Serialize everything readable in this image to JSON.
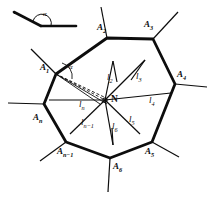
{
  "figure": {
    "background_color": "#ffffff",
    "ink_color": "#0d0d0d",
    "width": 210,
    "height": 198
  },
  "inset": {
    "name": "angle-alpha-inset",
    "angle_label": "α",
    "description": "Two rays meeting at a vertex with interior angle alpha marked by an arc"
  },
  "center_point": {
    "label": "N",
    "x": 105,
    "y": 100
  },
  "vertices": [
    {
      "id": "A1",
      "label_base": "A",
      "label_sub": "1",
      "label": "A₁",
      "x": 56,
      "y": 74,
      "label_x": 40,
      "label_y": 63
    },
    {
      "id": "A2",
      "label_base": "A",
      "label_sub": "2",
      "label": "A₂",
      "x": 107,
      "y": 38,
      "label_x": 97,
      "label_y": 23
    },
    {
      "id": "A3",
      "label_base": "A",
      "label_sub": "3",
      "label": "A₃",
      "x": 153,
      "y": 39,
      "label_x": 144,
      "label_y": 20
    },
    {
      "id": "A4",
      "label_base": "A",
      "label_sub": "4",
      "label": "A₄",
      "x": 175,
      "y": 84,
      "label_x": 177,
      "label_y": 70
    },
    {
      "id": "A5",
      "label_base": "A",
      "label_sub": "5",
      "label": "A₅",
      "x": 152,
      "y": 142,
      "label_x": 145,
      "label_y": 147
    },
    {
      "id": "A6",
      "label_base": "A",
      "label_sub": "6",
      "label": "A₆",
      "x": 110,
      "y": 158,
      "label_x": 113,
      "label_y": 162
    },
    {
      "id": "An-1",
      "label_base": "A",
      "label_sub": "n−1",
      "label": "Aₙ₋₁",
      "x": 66,
      "y": 142,
      "label_x": 62,
      "label_y": 147
    },
    {
      "id": "An",
      "label_base": "A",
      "label_sub": "n",
      "label": "Aₙ",
      "x": 44,
      "y": 104,
      "label_x": 33,
      "label_y": 113
    }
  ],
  "segments": [
    {
      "id": "l2",
      "label_base": "l",
      "label_sub": "2",
      "label": "l₂",
      "label_x": 107,
      "label_y": 73
    },
    {
      "id": "l3",
      "label_base": "l",
      "label_sub": "3",
      "label": "l₃",
      "label_x": 136,
      "label_y": 72
    },
    {
      "id": "l4",
      "label_base": "l",
      "label_sub": "4",
      "label": "l₄",
      "label_x": 149,
      "label_y": 96
    },
    {
      "id": "l5",
      "label_base": "l",
      "label_sub": "5",
      "label": "l₅",
      "label_x": 129,
      "label_y": 115
    },
    {
      "id": "l6",
      "label_base": "l",
      "label_sub": "6",
      "label": "l₆",
      "label_x": 112,
      "label_y": 122
    },
    {
      "id": "ln-1",
      "label_base": "l",
      "label_sub": "n−1",
      "label": "lₙ₋₁",
      "label_x": 86,
      "label_y": 118
    },
    {
      "id": "ln",
      "label_base": "l",
      "label_sub": "n",
      "label": "lₙ",
      "label_x": 81,
      "label_y": 102
    }
  ],
  "vertex_angle": {
    "label": "α",
    "at_vertex": "A1",
    "label_x": 69,
    "label_y": 69
  }
}
